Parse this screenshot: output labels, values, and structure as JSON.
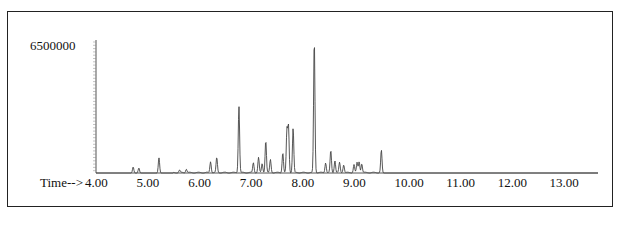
{
  "chart_data": {
    "type": "line",
    "title": "",
    "xlabel": "Time-->",
    "ylabel": "",
    "xlim": [
      4.0,
      13.9
    ],
    "ylim": [
      0,
      6600000
    ],
    "grid": false,
    "legend": null,
    "y_tick_labels": [
      "6500000"
    ],
    "x_tick_labels": [
      "4.00",
      "5.00",
      "6.00",
      "7.00",
      "8.00",
      "9.00",
      "10.00",
      "11.00",
      "12.00",
      "13.00"
    ],
    "x_ticks": [
      4.0,
      5.0,
      6.0,
      7.0,
      8.0,
      9.0,
      10.0,
      11.0,
      12.0,
      13.0
    ],
    "peaks": [
      {
        "time": 4.72,
        "abundance": 300000
      },
      {
        "time": 4.83,
        "abundance": 250000
      },
      {
        "time": 5.22,
        "abundance": 750000
      },
      {
        "time": 5.62,
        "abundance": 120000
      },
      {
        "time": 5.75,
        "abundance": 180000
      },
      {
        "time": 6.22,
        "abundance": 550000
      },
      {
        "time": 6.34,
        "abundance": 750000
      },
      {
        "time": 6.77,
        "abundance": 3300000
      },
      {
        "time": 7.05,
        "abundance": 500000
      },
      {
        "time": 7.15,
        "abundance": 750000
      },
      {
        "time": 7.22,
        "abundance": 450000
      },
      {
        "time": 7.29,
        "abundance": 1600000
      },
      {
        "time": 7.38,
        "abundance": 650000
      },
      {
        "time": 7.62,
        "abundance": 1000000
      },
      {
        "time": 7.7,
        "abundance": 2100000
      },
      {
        "time": 7.73,
        "abundance": 2300000
      },
      {
        "time": 7.82,
        "abundance": 2200000
      },
      {
        "time": 8.23,
        "abundance": 6600000
      },
      {
        "time": 8.45,
        "abundance": 500000
      },
      {
        "time": 8.55,
        "abundance": 1100000
      },
      {
        "time": 8.63,
        "abundance": 600000
      },
      {
        "time": 8.72,
        "abundance": 500000
      },
      {
        "time": 8.8,
        "abundance": 400000
      },
      {
        "time": 9.0,
        "abundance": 400000
      },
      {
        "time": 9.06,
        "abundance": 500000
      },
      {
        "time": 9.1,
        "abundance": 550000
      },
      {
        "time": 9.15,
        "abundance": 450000
      },
      {
        "time": 9.53,
        "abundance": 1150000
      }
    ]
  },
  "labels": {
    "y_max": "6500000",
    "x_prefix": "Time-->",
    "x_ticks": [
      "4.00",
      "5.00",
      "6.00",
      "7.00",
      "8.00",
      "9.00",
      "10.00",
      "11.00",
      "12.00",
      "13.00"
    ]
  }
}
